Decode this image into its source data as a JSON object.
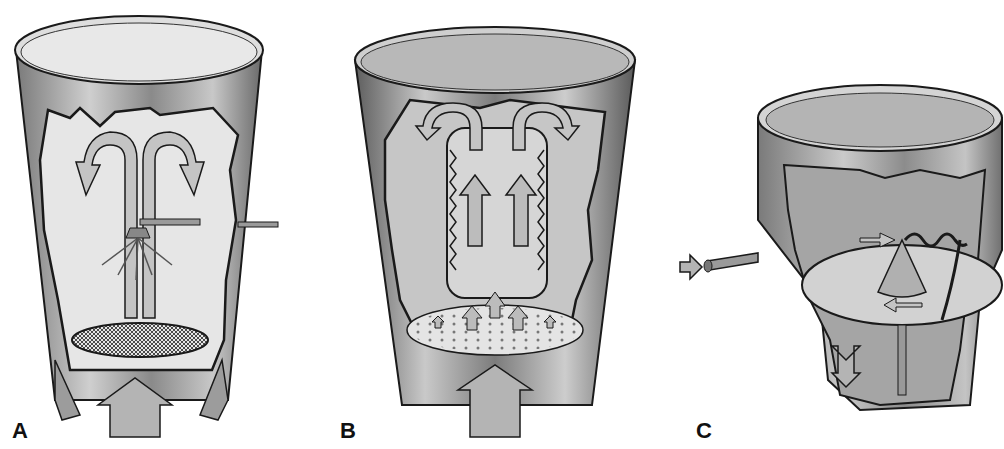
{
  "figure": {
    "panels": [
      {
        "id": "A",
        "label": "A",
        "description": "Top-spray fluid bed: spray nozzle from side pipe, mesh screen distributor, upward airflow arrow, fountain arrows"
      },
      {
        "id": "B",
        "label": "B",
        "description": "Bottom-spray (Wurster) fluid bed: inner partition column with upward arrows, perforated distributor plate, large upward air arrow"
      },
      {
        "id": "C",
        "label": "C",
        "description": "Tangential-spray (rotor) fluid bed: rotating disc with central cone, side spray pipe, adjustable gap arrow"
      }
    ]
  },
  "colors": {
    "metal_dark": "#6e6e6e",
    "metal_mid": "#a8a8a8",
    "metal_light": "#d8d8d8",
    "outline": "#1a1a1a",
    "arrow_fill": "#b4b4b4"
  }
}
